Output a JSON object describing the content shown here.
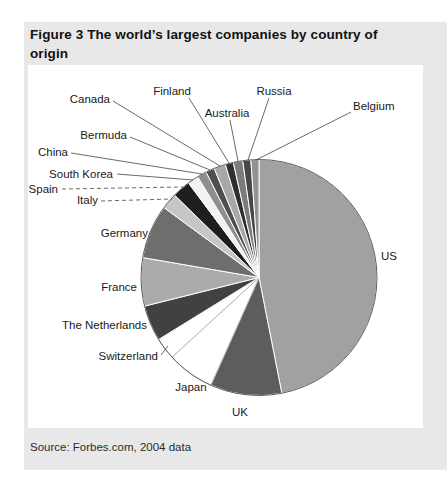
{
  "header": {
    "title_lines": [
      "Figure 3 The world’s largest companies by country of",
      "origin"
    ]
  },
  "footer": {
    "source": "Source: Forbes.com, 2004 data"
  },
  "colors": {
    "figure_background": "#e8e8e8",
    "panel_background": "#ffffff",
    "pie_outline": "#5f5f5f",
    "leader_line": "#444444",
    "label_text": "#1a1a1a",
    "title_text": "#111111"
  },
  "chart_data": {
    "type": "pie",
    "title": "Figure 3 The world’s largest companies by country of origin",
    "source": "Source: Forbes.com, 2004 data",
    "legend_position": "none (direct labels with leader lines)",
    "start_angle_deg": 0,
    "direction": "clockwise from 12 o'clock",
    "slices": [
      {
        "label": "US",
        "value_pct": 46.9,
        "color": "#a1a1a1",
        "label_x": 381,
        "label_y": 260,
        "label_anchor": "start",
        "leader": null,
        "leader_dashed": false
      },
      {
        "label": "UK",
        "value_pct": 9.8,
        "color": "#5d5d5d",
        "label_x": 240,
        "label_y": 416,
        "label_anchor": "middle",
        "leader": null,
        "leader_dashed": false
      },
      {
        "label": "Japan",
        "value_pct": 6.5,
        "color": "#ffffff",
        "label_x": 191,
        "label_y": 391,
        "label_anchor": "middle",
        "leader": null,
        "leader_dashed": false
      },
      {
        "label": "Switzerland",
        "value_pct": 3.0,
        "color": "#ffffff",
        "label_x": 158,
        "label_y": 360,
        "label_anchor": "end",
        "leader": [
          161,
          355,
          168,
          346
        ],
        "leader_dashed": false
      },
      {
        "label": "The Netherlands",
        "value_pct": 4.9,
        "color": "#414141",
        "label_x": 147,
        "label_y": 329,
        "label_anchor": "end",
        "leader": null,
        "leader_dashed": false
      },
      {
        "label": "France",
        "value_pct": 6.6,
        "color": "#ababab",
        "label_x": 137,
        "label_y": 291,
        "label_anchor": "end",
        "leader": null,
        "leader_dashed": false
      },
      {
        "label": "Germany",
        "value_pct": 7.4,
        "color": "#6e6e6e",
        "label_x": 148,
        "label_y": 237,
        "label_anchor": "end",
        "leader": null,
        "leader_dashed": false
      },
      {
        "label": "Italy",
        "value_pct": 2.2,
        "color": "#c6c6c6",
        "label_x": 98,
        "label_y": 204,
        "label_anchor": "end",
        "leader": [
          101,
          201,
          172,
          199
        ],
        "leader_dashed": true
      },
      {
        "label": "Spain",
        "value_pct": 2.5,
        "color": "#1e1e1e",
        "label_x": 58,
        "label_y": 193,
        "label_anchor": "end",
        "leader": [
          62,
          189,
          183,
          187
        ],
        "leader_dashed": true
      },
      {
        "label": "South Korea",
        "value_pct": 1.5,
        "color": "#f2f2f2",
        "label_x": 113,
        "label_y": 178,
        "label_anchor": "end",
        "leader": [
          117,
          174,
          193,
          180
        ],
        "leader_dashed": false
      },
      {
        "label": "China",
        "value_pct": 1.3,
        "color": "#8e8e8e",
        "label_x": 68,
        "label_y": 156,
        "label_anchor": "end",
        "leader": [
          71,
          153,
          202,
          174
        ],
        "leader_dashed": false
      },
      {
        "label": "Bermuda",
        "value_pct": 1.2,
        "color": "#4f4f4f",
        "label_x": 127,
        "label_y": 139,
        "label_anchor": "end",
        "leader": [
          130,
          137,
          210,
          170
        ],
        "leader_dashed": false
      },
      {
        "label": "Canada",
        "value_pct": 1.6,
        "color": "#a8a8a8",
        "label_x": 110,
        "label_y": 103,
        "label_anchor": "end",
        "leader": [
          113,
          101,
          220,
          166
        ],
        "leader_dashed": false
      },
      {
        "label": "Finland",
        "value_pct": 1.1,
        "color": "#2f2f2f",
        "label_x": 172,
        "label_y": 95,
        "label_anchor": "middle",
        "leader": [
          189,
          98,
          229,
          163
        ],
        "leader_dashed": false
      },
      {
        "label": "Australia",
        "value_pct": 1.3,
        "color": "#7c7c7c",
        "label_x": 227,
        "label_y": 117,
        "label_anchor": "middle",
        "leader": [
          230,
          120,
          238,
          161
        ],
        "leader_dashed": false
      },
      {
        "label": "Russia",
        "value_pct": 1.1,
        "color": "#464646",
        "label_x": 274,
        "label_y": 95,
        "label_anchor": "middle",
        "leader": [
          269,
          98,
          248,
          160
        ],
        "leader_dashed": false
      },
      {
        "label": "Belgium",
        "value_pct": 1.1,
        "color": "#929292",
        "label_x": 353,
        "label_y": 110,
        "label_anchor": "start",
        "leader": [
          351,
          112,
          256,
          160
        ],
        "leader_dashed": false
      }
    ]
  }
}
